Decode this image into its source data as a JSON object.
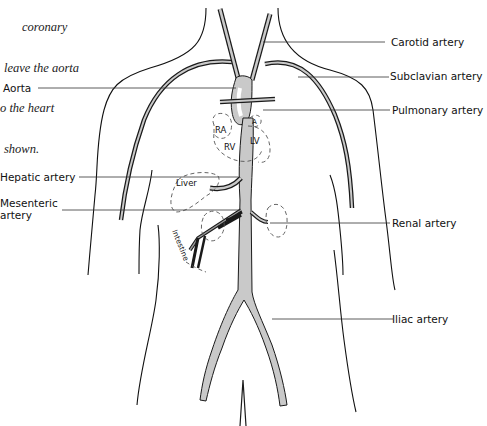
{
  "caption": {
    "lines": [
      "coronary",
      "leave the aorta",
      "o the heart",
      "shown."
    ]
  },
  "labels": {
    "left": {
      "aorta": "Aorta",
      "hepatic": "Hepatic artery",
      "mesenteric_1": "Mesenteric",
      "mesenteric_2": "artery"
    },
    "right": {
      "carotid": "Carotid artery",
      "subclavian": "Subclavian artery",
      "pulmonary": "Pulmonary artery",
      "renal": "Renal artery",
      "iliac": "Iliac artery"
    },
    "inner": {
      "ra": "RA",
      "rv": "RV",
      "lv": "LV",
      "la": "A",
      "liver": "Liver",
      "intestine": "Intestine"
    }
  },
  "colors": {
    "artery_fill": "#c9c9c9",
    "outline": "#111111",
    "background": "#ffffff"
  }
}
